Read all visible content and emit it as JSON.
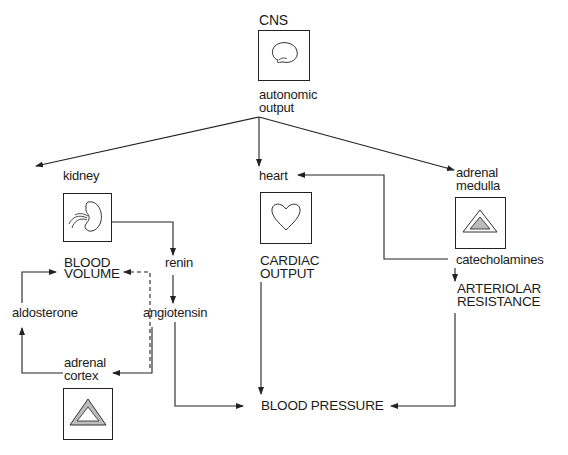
{
  "diagram": {
    "nodes": {
      "cns": {
        "label": "CNS",
        "icon": "brain-icon"
      },
      "autonomic_output": {
        "line1": "autonomic",
        "line2": "output"
      },
      "kidney": {
        "label": "kidney",
        "icon": "kidney-icon"
      },
      "heart": {
        "label": "heart",
        "icon": "heart-icon"
      },
      "adrenal_medulla": {
        "line1": "adrenal",
        "line2": "medulla",
        "icon": "adrenal-medulla-icon"
      },
      "blood_volume": {
        "line1": "BLOOD",
        "line2": "VOLUME"
      },
      "renin": {
        "label": "renin"
      },
      "angiotensin": {
        "label": "angiotensin"
      },
      "aldosterone": {
        "label": "aldosterone"
      },
      "adrenal_cortex": {
        "line1": "adrenal",
        "line2": "cortex",
        "icon": "adrenal-cortex-icon"
      },
      "cardiac_output": {
        "line1": "CARDIAC",
        "line2": "OUTPUT"
      },
      "catecholamines": {
        "label": "catecholamines"
      },
      "arteriolar_resistance": {
        "line1": "ARTERIOLAR",
        "line2": "RESISTANCE"
      },
      "blood_pressure": {
        "label": "BLOOD PRESSURE"
      }
    },
    "edges": [
      {
        "from": "autonomic output",
        "to": "kidney",
        "style": "solid"
      },
      {
        "from": "autonomic output",
        "to": "heart",
        "style": "solid"
      },
      {
        "from": "autonomic output",
        "to": "adrenal medulla",
        "style": "solid"
      },
      {
        "from": "kidney",
        "to": "renin",
        "style": "solid"
      },
      {
        "from": "renin",
        "to": "angiotensin",
        "style": "solid"
      },
      {
        "from": "angiotensin",
        "to": "BLOOD VOLUME",
        "style": "dashed"
      },
      {
        "from": "angiotensin",
        "to": "adrenal cortex",
        "style": "solid"
      },
      {
        "from": "adrenal cortex",
        "to": "aldosterone",
        "style": "solid"
      },
      {
        "from": "aldosterone",
        "to": "BLOOD VOLUME",
        "style": "solid"
      },
      {
        "from": "angiotensin",
        "to": "BLOOD PRESSURE",
        "style": "solid"
      },
      {
        "from": "CARDIAC OUTPUT",
        "to": "BLOOD PRESSURE",
        "style": "solid"
      },
      {
        "from": "catecholamines",
        "to": "heart",
        "style": "solid"
      },
      {
        "from": "catecholamines",
        "to": "ARTERIOLAR RESISTANCE",
        "style": "solid"
      },
      {
        "from": "ARTERIOLAR RESISTANCE",
        "to": "BLOOD PRESSURE",
        "style": "solid"
      }
    ],
    "colors": {
      "line": "#222222",
      "background": "#ffffff",
      "stipple": "#9a9a9a"
    }
  }
}
